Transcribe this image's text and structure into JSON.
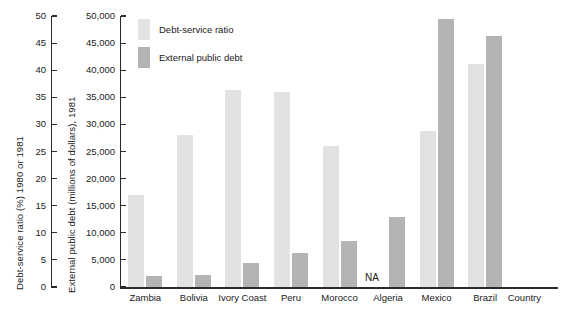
{
  "chart_data": {
    "type": "bar",
    "title": "",
    "categories": [
      "Zambia",
      "Bolivia",
      "Ivory Coast",
      "Peru",
      "Morocco",
      "Algeria",
      "Mexico",
      "Brazil"
    ],
    "series": [
      {
        "name": "Debt-service ratio",
        "color": "#e2e2e2",
        "axis": "left",
        "values": [
          17,
          28,
          36.3,
          36,
          26,
          null,
          28.8,
          41.2
        ],
        "value_labels": [
          "17",
          "28",
          "36.3",
          "36",
          "26",
          "NA",
          "28.8",
          "41.2"
        ]
      },
      {
        "name": "External public debt",
        "color": "#b4b4b4",
        "axis": "right",
        "values": [
          2000,
          2300,
          4400,
          6300,
          8500,
          13000,
          49500,
          46300
        ],
        "value_labels": [
          "2,000",
          "2,300",
          "4,400",
          "6,300",
          "8,500",
          "13,000",
          "49,500",
          "46,300"
        ]
      }
    ],
    "missing_label": "NA",
    "missing_category": "Algeria",
    "xlabel": "Country",
    "ylabel_left": "Debt-service ratio (%) 1980 or 1981",
    "ylabel_right": "External public debt (millions of dollars), 1981",
    "ylim_left": [
      0,
      50
    ],
    "ylim_right": [
      0,
      50000
    ],
    "yticks_left": [
      "0",
      "5",
      "10",
      "15",
      "20",
      "25",
      "30",
      "35",
      "40",
      "45",
      "50"
    ],
    "yticks_right": [
      "0",
      "5,000",
      "10,000",
      "15,000",
      "20,000",
      "25,000",
      "30,000",
      "35,000",
      "40,000",
      "45,000",
      "50,000"
    ],
    "grid": false,
    "legend_position": "top-left-inside"
  },
  "legend": {
    "items": [
      {
        "label": "Debt-service ratio",
        "color": "#e2e2e2"
      },
      {
        "label": "External public debt",
        "color": "#b4b4b4"
      }
    ]
  }
}
